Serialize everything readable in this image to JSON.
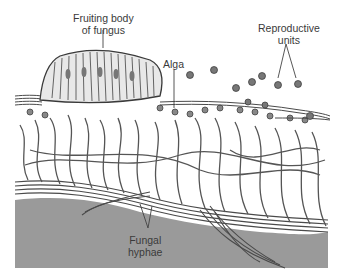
{
  "figure": {
    "labels": {
      "fruiting_body": {
        "line1": "Fruiting body",
        "line2": "of fungus"
      },
      "alga": "Alga",
      "reproductive_units": {
        "line1": "Reproductive",
        "line2": "units"
      },
      "fungal_hyphae": {
        "line1": "Fungal",
        "line2": "hyphae"
      }
    },
    "colors": {
      "substrate": "#9a9a9a",
      "hyphae_stroke": "#4a4a4a",
      "hyphae_fill": "#d8d8d8",
      "background": "#ffffff",
      "label_text": "#3a3a3a"
    }
  }
}
